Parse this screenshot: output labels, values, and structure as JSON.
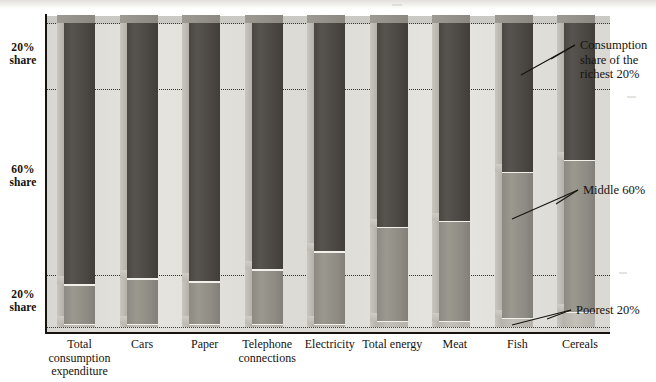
{
  "chart_data": {
    "type": "bar",
    "subtype": "stacked-bar-3d",
    "title": "",
    "xlabel": "",
    "ylabel": "",
    "ylim": [
      0,
      100
    ],
    "grid": true,
    "gridlines": [
      0,
      20,
      80,
      100
    ],
    "legend_position": "right-annotations",
    "axis_labels": [
      {
        "text_line1": "20%",
        "text_line2": "share",
        "value": 20,
        "position": "top"
      },
      {
        "text_line1": "60%",
        "text_line2": "share",
        "value": 60,
        "position": "middle"
      },
      {
        "text_line1": "20%",
        "text_line2": "share",
        "value": 20,
        "position": "bottom"
      }
    ],
    "categories": [
      "Total consumption expenditure",
      "Cars",
      "Paper",
      "Telephone connections",
      "Electricity",
      "Total energy",
      "Meat",
      "Fish",
      "Cereals"
    ],
    "category_labels": [
      {
        "lines": [
          "Total",
          "consumption",
          "expenditure"
        ]
      },
      {
        "lines": [
          "Cars"
        ]
      },
      {
        "lines": [
          "Paper"
        ]
      },
      {
        "lines": [
          "Telephone",
          "connections"
        ]
      },
      {
        "lines": [
          "Electricity"
        ]
      },
      {
        "lines": [
          "Total energy"
        ]
      },
      {
        "lines": [
          "Meat"
        ]
      },
      {
        "lines": [
          "Fish"
        ]
      },
      {
        "lines": [
          "Cereals"
        ]
      }
    ],
    "series": [
      {
        "name": "Consumption share of the richest 20%",
        "color": "#4b4743",
        "values": [
          86,
          84,
          85,
          81,
          75,
          67,
          65,
          49,
          45
        ]
      },
      {
        "name": "Middle 60%",
        "color": "#8e8b84",
        "values": [
          13,
          15,
          14,
          18,
          24,
          31,
          33,
          48,
          50
        ]
      },
      {
        "name": "Poorest 20%",
        "color": "#b7b4ad",
        "values": [
          1,
          1,
          1,
          1,
          1,
          2,
          2,
          3,
          5
        ]
      }
    ],
    "annotations": [
      {
        "id": "richest",
        "lines": [
          "Consumption",
          "share of the",
          "richest 20%"
        ]
      },
      {
        "id": "middle",
        "lines": [
          "Middle 60%"
        ]
      },
      {
        "id": "poorest",
        "lines": [
          "Poorest 20%"
        ]
      }
    ],
    "colors": {
      "richest": "#4b4743",
      "middle": "#8e8b84",
      "poorest": "#b7b4ad",
      "panel": "#dedcd6",
      "axis": "#17140f",
      "gridline": "#2a2620",
      "background": "#ffffff"
    }
  }
}
